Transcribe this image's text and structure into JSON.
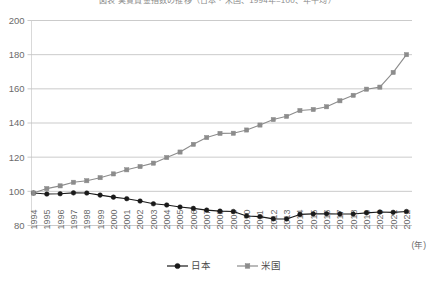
{
  "chart_data": {
    "type": "line",
    "title": "図表 実質賃金指数の推移（日本・米国、1994年=100、年平均）",
    "xlabel": "(年)",
    "ylabel": "",
    "ylim": [
      80,
      200
    ],
    "ytick_step": 20,
    "yticks": [
      80,
      100,
      120,
      140,
      160,
      180,
      200
    ],
    "grid": true,
    "legend_position": "bottom",
    "x": [
      1994,
      1995,
      1996,
      1997,
      1998,
      1999,
      2000,
      2001,
      2002,
      2003,
      2004,
      2005,
      2006,
      2007,
      2008,
      2009,
      2010,
      2011,
      2012,
      2013,
      2014,
      2015,
      2016,
      2017,
      2018,
      2019,
      2020,
      2021,
      2022
    ],
    "xtick_labels": [
      "1994",
      "1995",
      "1996",
      "1997",
      "1998",
      "1999",
      "2000",
      "2001",
      "2002",
      "2003",
      "2004",
      "2005",
      "2006",
      "2007",
      "2008",
      "2009",
      "2010",
      "2011",
      "2012",
      "2013",
      "2014",
      "2015",
      "2016",
      "2017",
      "2018",
      "2019",
      "2020",
      "2021",
      "2022"
    ],
    "series": [
      {
        "name": "日本",
        "color": "#1a1a1a",
        "marker": "circle",
        "values": [
          99.0,
          98.4,
          98.6,
          99.1,
          99.0,
          97.8,
          96.6,
          95.7,
          94.3,
          92.7,
          92.0,
          90.8,
          90.0,
          89.0,
          88.4,
          88.2,
          85.6,
          85.2,
          83.9,
          83.8,
          86.5,
          86.8,
          86.9,
          86.7,
          86.7,
          87.4,
          87.9,
          87.7,
          88.2
        ]
      },
      {
        "name": "米国",
        "color": "#8c8c8c",
        "marker": "square",
        "values": [
          99.0,
          101.6,
          103.2,
          105.3,
          106.2,
          108.0,
          110.2,
          112.6,
          114.5,
          116.5,
          119.8,
          123.0,
          127.5,
          131.5,
          133.9,
          134.0,
          135.9,
          138.8,
          142.0,
          143.9,
          147.3,
          147.9,
          149.5,
          153.0,
          156.2,
          159.8,
          161.0,
          169.6,
          180.0
        ]
      }
    ],
    "legend": [
      {
        "label": "日本",
        "color": "#1a1a1a",
        "marker": "circle"
      },
      {
        "label": "米国",
        "color": "#8c8c8c",
        "marker": "square"
      }
    ]
  }
}
